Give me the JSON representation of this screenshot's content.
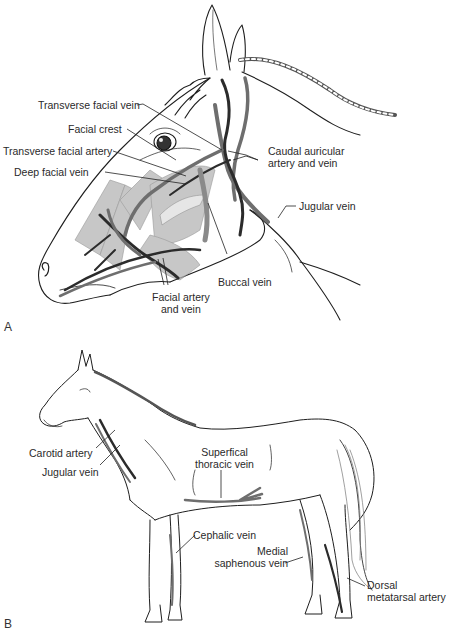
{
  "figure": {
    "panels": [
      {
        "letter": "A",
        "subject": "Horse head, lateral view",
        "labels": {
          "transverse_facial_vein": "Transverse facial vein",
          "facial_crest": "Facial crest",
          "transverse_facial_artery": "Transverse facial artery",
          "deep_facial_vein": "Deep facial vein",
          "caudal_auricular_line1": "Caudal auricular",
          "caudal_auricular_line2": "artery and vein",
          "jugular_vein": "Jugular vein",
          "buccal_vein": "Buccal vein",
          "facial_artery_line1": "Facial artery",
          "facial_artery_line2": "and vein"
        }
      },
      {
        "letter": "B",
        "subject": "Whole horse, lateral view",
        "labels": {
          "carotid_artery": "Carotid artery",
          "jugular_vein": "Jugular vein",
          "superficial_thoracic_line1": "Superfical",
          "superficial_thoracic_line2": "thoracic vein",
          "cephalic_vein": "Cephalic vein",
          "medial_saphenous_line1": "Medial",
          "medial_saphenous_line2": "saphenous vein",
          "dorsal_metatarsal_line1": "Dorsal",
          "dorsal_metatarsal_line2": "metatarsal artery"
        }
      }
    ],
    "colors": {
      "outline": "#1e1e1e",
      "vein": "#6e6e6e",
      "artery": "#2b2b2b",
      "muscle": "#b5b5b5",
      "background": "#ffffff"
    }
  }
}
